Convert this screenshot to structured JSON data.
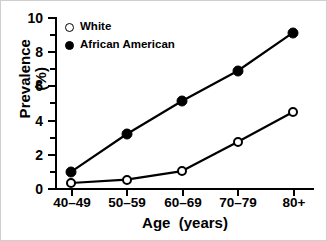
{
  "chart_data": {
    "type": "line",
    "title": "",
    "xlabel": "Age  (years)",
    "ylabel_line1": "Prevalence",
    "ylabel_line2": "(%)",
    "categories": [
      "40–49",
      "50–59",
      "60–69",
      "70–79",
      "80+"
    ],
    "series": [
      {
        "name": "White",
        "marker": "open-circle",
        "color": "#000000",
        "values": [
          0.35,
          0.55,
          1.05,
          2.75,
          4.5
        ]
      },
      {
        "name": "African American",
        "marker": "filled-circle",
        "color": "#000000",
        "values": [
          1.0,
          3.2,
          5.15,
          6.9,
          9.15
        ]
      }
    ],
    "ylim": [
      0,
      10
    ],
    "yticks": [
      0,
      2,
      4,
      6,
      8,
      10
    ],
    "ytick_labels": [
      "0",
      "2",
      "4",
      "6",
      "8",
      "10"
    ],
    "yminorticks": [
      1,
      3,
      5,
      7,
      9
    ],
    "grid": false,
    "legend_position": "top-left"
  },
  "legend": {
    "entries": [
      {
        "label": "White",
        "marker": "open-circle"
      },
      {
        "label": "African American",
        "marker": "filled-circle"
      }
    ]
  }
}
